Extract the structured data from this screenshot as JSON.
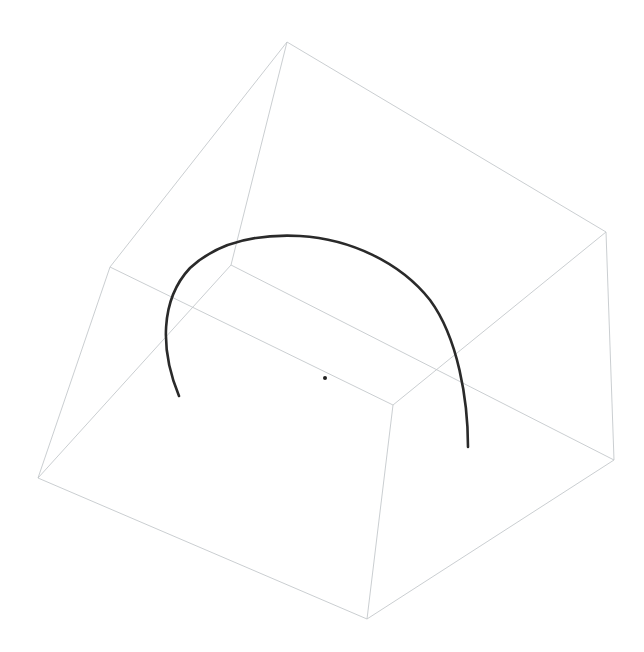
{
  "scene": {
    "type": "3d-wireframe-box-with-arc",
    "background": "#ffffff",
    "edge_color": "#c4c8cc",
    "arc_color": "#2a2a2a",
    "dot_color": "#222222"
  },
  "vertices": {
    "top": [
      287,
      42
    ],
    "right": [
      606,
      232
    ],
    "left_mid": [
      110,
      267
    ],
    "inner": [
      231,
      265
    ],
    "front_inner": [
      393,
      405
    ],
    "bottom_left": [
      38,
      478
    ],
    "bottom": [
      367,
      619
    ],
    "bottom_right": [
      614,
      460
    ]
  },
  "edges": [
    [
      "top",
      "right"
    ],
    [
      "top",
      "left_mid"
    ],
    [
      "top",
      "inner"
    ],
    [
      "right",
      "bottom_right"
    ],
    [
      "right",
      "front_inner"
    ],
    [
      "left_mid",
      "bottom_left"
    ],
    [
      "left_mid",
      "front_inner"
    ],
    [
      "inner",
      "bottom_left"
    ],
    [
      "inner",
      "bottom_right"
    ],
    [
      "bottom_left",
      "bottom"
    ],
    [
      "bottom",
      "bottom_right"
    ],
    [
      "front_inner",
      "bottom"
    ]
  ],
  "arc": {
    "start": [
      179,
      396
    ],
    "end": [
      468,
      447
    ],
    "path": "M179,396 C160,350 160,300 190,268 C220,240 260,234 300,236 C350,239 400,262 430,300 C458,338 468,400 468,447"
  },
  "center_dot": [
    325,
    378
  ]
}
